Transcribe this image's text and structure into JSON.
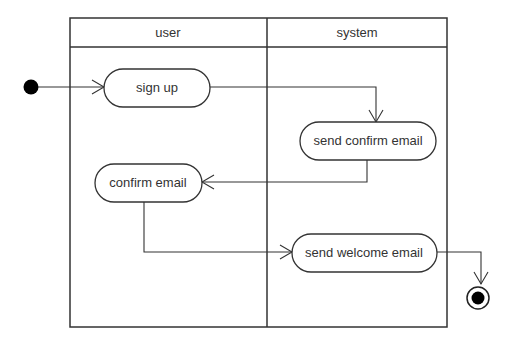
{
  "diagram": {
    "type": "activity-diagram",
    "swimlanes": [
      {
        "id": "user",
        "title": "user"
      },
      {
        "id": "system",
        "title": "system"
      }
    ],
    "nodes": [
      {
        "id": "start",
        "kind": "initial"
      },
      {
        "id": "sign_up",
        "kind": "action",
        "label": "sign up",
        "lane": "user"
      },
      {
        "id": "send_confirm",
        "kind": "action",
        "label": "send confirm email",
        "lane": "system"
      },
      {
        "id": "confirm_email",
        "kind": "action",
        "label": "confirm email",
        "lane": "user"
      },
      {
        "id": "send_welcome",
        "kind": "action",
        "label": "send welcome email",
        "lane": "system"
      },
      {
        "id": "end",
        "kind": "final"
      }
    ],
    "edges": [
      {
        "from": "start",
        "to": "sign_up"
      },
      {
        "from": "sign_up",
        "to": "send_confirm"
      },
      {
        "from": "send_confirm",
        "to": "confirm_email"
      },
      {
        "from": "confirm_email",
        "to": "send_welcome"
      },
      {
        "from": "send_welcome",
        "to": "end"
      }
    ]
  }
}
